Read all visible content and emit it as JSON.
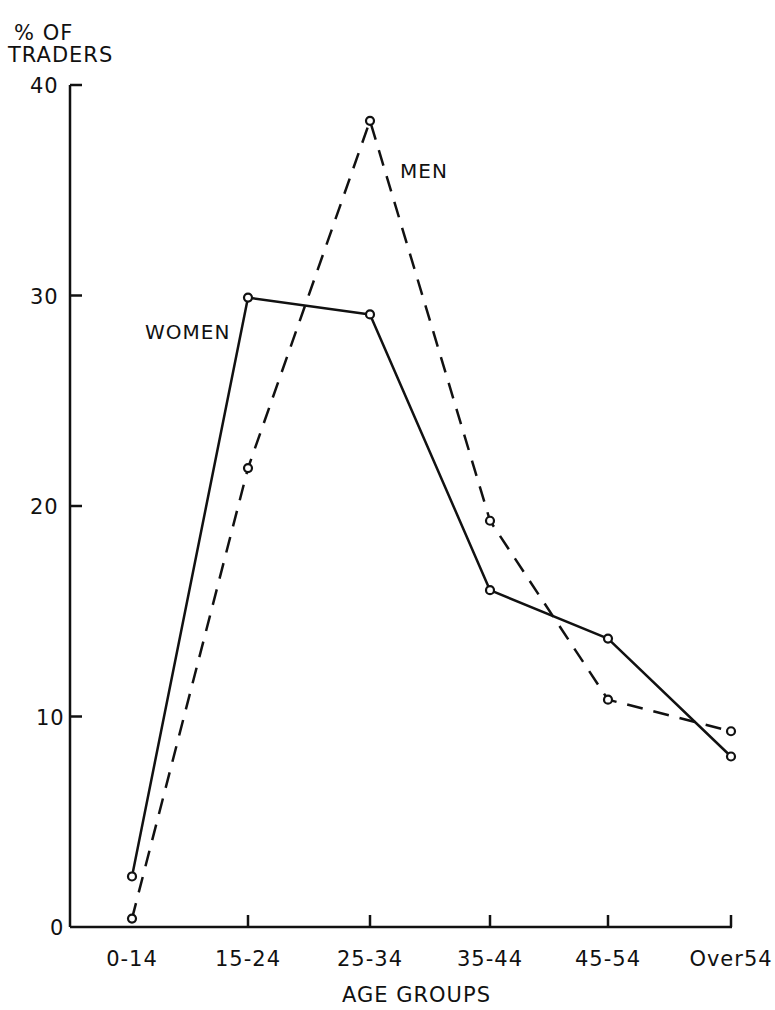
{
  "chart_data": {
    "type": "line",
    "title": "",
    "xlabel": "AGE GROUPS",
    "ylabel": "% OF TRADERS",
    "ylabel_lines": [
      "% OF",
      "TRADERS"
    ],
    "categories": [
      "0-14",
      "15-24",
      "25-34",
      "35-44",
      "45-54",
      "Over54"
    ],
    "ylim": [
      0,
      40
    ],
    "yticks": [
      0,
      10,
      20,
      30,
      40
    ],
    "grid": false,
    "legend": "inline labels",
    "series": [
      {
        "name": "WOMEN",
        "style": "solid",
        "values": [
          2.4,
          29.9,
          29.1,
          16.0,
          13.7,
          8.1
        ]
      },
      {
        "name": "MEN",
        "style": "dashed",
        "values": [
          0.4,
          21.8,
          38.3,
          19.3,
          10.8,
          9.3
        ]
      }
    ],
    "annotations": [
      {
        "text": "WOMEN",
        "near": "15-24"
      },
      {
        "text": "MEN",
        "near": "25-34"
      }
    ]
  },
  "colors": {
    "ink": "#111111",
    "background": "#ffffff"
  }
}
